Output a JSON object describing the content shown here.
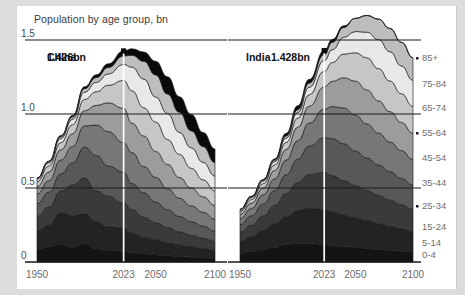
{
  "chart_title": "Population by age group, bn",
  "panels": [
    {
      "id": "china",
      "name": "China",
      "peak_label": "1.426bn",
      "peak_year": 2023
    },
    {
      "id": "india",
      "name": "India",
      "peak_label": "1.428bn",
      "peak_year": 2023
    }
  ],
  "yaxis": {
    "ticks": [
      "0",
      "0.5",
      "1.0",
      "1.5"
    ],
    "values": [
      0,
      0.5,
      1.0,
      1.5
    ],
    "min": 0,
    "max": 1.5
  },
  "xaxis": {
    "ticks": [
      "1950",
      "2023",
      "2050",
      "2100"
    ],
    "values": [
      1950,
      2023,
      2050,
      2100
    ],
    "min": 1950,
    "max": 2100
  },
  "legend": {
    "position": "right",
    "labels": [
      "85+",
      "75-84",
      "65-74",
      "55-64",
      "45-54",
      "35-44",
      "25-34",
      "15-24",
      "5-14",
      "0-4"
    ]
  },
  "colors": {
    "background": "#dcdcda",
    "card": "#ffffff",
    "axis": "#1a1a1a",
    "marker": "#ffffff",
    "bands": [
      "#0a0a0a",
      "#3b3b3b",
      "#585858",
      "#f0f0f0",
      "#d4d4d4",
      "#8f8f8f",
      "#6a6a6a",
      "#4a4a4a",
      "#2a2a2a",
      "#121212"
    ]
  },
  "chart_data": {
    "type": "area",
    "title": "Population by age group, bn",
    "xlabel": "",
    "ylabel": "Population, bn",
    "ylim": [
      0,
      1.5
    ],
    "xlim": [
      1950,
      2100
    ],
    "grid": true,
    "legend_position": "right",
    "stack_order_bottom_to_top": [
      "0-4",
      "5-14",
      "15-24",
      "25-34",
      "35-44",
      "45-54",
      "55-64",
      "65-74",
      "75-84",
      "85+"
    ],
    "x": [
      1950,
      1960,
      1970,
      1980,
      1990,
      2000,
      2010,
      2023,
      2030,
      2040,
      2050,
      2060,
      2070,
      2080,
      2090,
      2100
    ],
    "panels": [
      {
        "name": "China",
        "total": [
          0.544,
          0.654,
          0.818,
          0.983,
          1.144,
          1.264,
          1.34,
          1.426,
          1.416,
          1.378,
          1.313,
          1.221,
          1.11,
          0.999,
          0.898,
          0.767
        ],
        "series": [
          {
            "name": "0-4",
            "values": [
              0.08,
              0.098,
              0.115,
              0.094,
              0.118,
              0.084,
              0.076,
              0.07,
              0.06,
              0.052,
              0.046,
              0.04,
              0.035,
              0.031,
              0.028,
              0.024
            ]
          },
          {
            "name": "5-14",
            "values": [
              0.12,
              0.14,
              0.205,
              0.205,
              0.194,
              0.176,
              0.15,
              0.152,
              0.128,
              0.108,
              0.096,
              0.084,
              0.074,
              0.066,
              0.058,
              0.05
            ]
          },
          {
            "name": "15-24",
            "values": [
              0.095,
              0.118,
              0.14,
              0.2,
              0.232,
              0.2,
              0.2,
              0.16,
              0.152,
              0.13,
              0.112,
              0.098,
              0.086,
              0.076,
              0.068,
              0.058
            ]
          },
          {
            "name": "25-34",
            "values": [
              0.082,
              0.095,
              0.11,
              0.143,
              0.2,
              0.229,
              0.195,
              0.2,
              0.168,
              0.158,
              0.134,
              0.116,
              0.1,
              0.088,
              0.078,
              0.068
            ]
          },
          {
            "name": "35-44",
            "values": [
              0.063,
              0.075,
              0.09,
              0.106,
              0.137,
              0.197,
              0.223,
              0.19,
              0.2,
              0.17,
              0.16,
              0.136,
              0.118,
              0.102,
              0.09,
              0.078
            ]
          },
          {
            "name": "45-54",
            "values": [
              0.048,
              0.056,
              0.066,
              0.082,
              0.098,
              0.128,
              0.186,
              0.223,
              0.19,
              0.198,
              0.168,
              0.158,
              0.134,
              0.116,
              0.1,
              0.088
            ]
          },
          {
            "name": "55-64",
            "values": [
              0.032,
              0.039,
              0.046,
              0.059,
              0.073,
              0.088,
              0.114,
              0.18,
              0.211,
              0.182,
              0.19,
              0.161,
              0.15,
              0.128,
              0.11,
              0.094
            ]
          },
          {
            "name": "65-74",
            "values": [
              0.016,
              0.02,
              0.026,
              0.035,
              0.047,
              0.061,
              0.073,
              0.104,
              0.152,
              0.186,
              0.162,
              0.168,
              0.142,
              0.132,
              0.113,
              0.096
            ]
          },
          {
            "name": "75-84",
            "values": [
              0.006,
              0.009,
              0.013,
              0.016,
              0.023,
              0.031,
              0.042,
              0.055,
              0.077,
              0.115,
              0.143,
              0.126,
              0.13,
              0.11,
              0.102,
              0.088
            ]
          },
          {
            "name": "85+",
            "values": [
              0.002,
              0.004,
              0.007,
              0.009,
              0.012,
              0.018,
              0.024,
              0.032,
              0.042,
              0.06,
              0.088,
              0.112,
              0.101,
              0.106,
              0.091,
              0.088
            ]
          }
        ]
      },
      {
        "name": "India",
        "total": [
          0.357,
          0.445,
          0.557,
          0.697,
          0.87,
          1.056,
          1.234,
          1.428,
          1.504,
          1.596,
          1.639,
          1.64,
          1.603,
          1.533,
          1.437,
          1.327
        ],
        "series": [
          {
            "name": "0-4",
            "values": [
              0.056,
              0.069,
              0.085,
              0.1,
              0.117,
              0.123,
              0.123,
              0.115,
              0.11,
              0.104,
              0.098,
              0.092,
              0.085,
              0.079,
              0.073,
              0.067
            ]
          },
          {
            "name": "5-14",
            "values": [
              0.082,
              0.1,
              0.128,
              0.158,
              0.19,
              0.224,
              0.24,
              0.24,
              0.228,
              0.214,
              0.2,
              0.188,
              0.174,
              0.162,
              0.15,
              0.138
            ]
          },
          {
            "name": "15-24",
            "values": [
              0.063,
              0.079,
              0.098,
              0.124,
              0.156,
              0.19,
              0.228,
              0.25,
              0.246,
              0.232,
              0.218,
              0.204,
              0.191,
              0.177,
              0.164,
              0.151
            ]
          },
          {
            "name": "25-34",
            "values": [
              0.052,
              0.064,
              0.08,
              0.1,
              0.126,
              0.158,
              0.192,
              0.235,
              0.25,
              0.248,
              0.234,
              0.22,
              0.206,
              0.192,
              0.178,
              0.164
            ]
          },
          {
            "name": "35-44",
            "values": [
              0.04,
              0.05,
              0.063,
              0.079,
              0.099,
              0.124,
              0.155,
              0.193,
              0.216,
              0.243,
              0.242,
              0.229,
              0.215,
              0.201,
              0.187,
              0.173
            ]
          },
          {
            "name": "45-54",
            "values": [
              0.029,
              0.036,
              0.045,
              0.057,
              0.072,
              0.091,
              0.114,
              0.15,
              0.171,
              0.204,
              0.23,
              0.23,
              0.218,
              0.205,
              0.191,
              0.177
            ]
          },
          {
            "name": "55-64",
            "values": [
              0.019,
              0.024,
              0.03,
              0.038,
              0.048,
              0.061,
              0.078,
              0.106,
              0.127,
              0.16,
              0.192,
              0.217,
              0.218,
              0.207,
              0.194,
              0.181
            ]
          },
          {
            "name": "65-74",
            "values": [
              0.01,
              0.013,
              0.017,
              0.022,
              0.029,
              0.038,
              0.05,
              0.072,
              0.086,
              0.113,
              0.143,
              0.173,
              0.196,
              0.198,
              0.188,
              0.177
            ]
          },
          {
            "name": "75-84",
            "values": [
              0.004,
              0.006,
              0.008,
              0.011,
              0.015,
              0.02,
              0.029,
              0.041,
              0.05,
              0.067,
              0.089,
              0.113,
              0.138,
              0.157,
              0.159,
              0.152
            ]
          },
          {
            "name": "85+",
            "values": [
              0.002,
              0.004,
              0.003,
              0.008,
              0.018,
              0.027,
              0.025,
              0.026,
              0.02,
              0.011,
              0.0,
              0.0,
              0.0,
              0.0,
              0.0,
              0.0
            ]
          }
        ]
      }
    ]
  }
}
